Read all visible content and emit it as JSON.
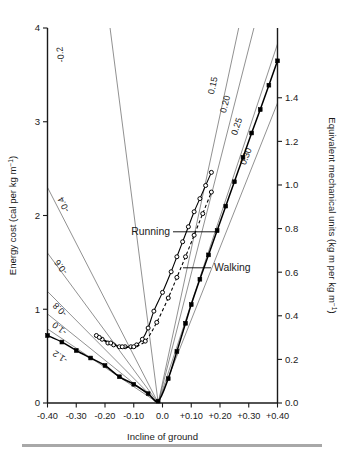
{
  "figure": {
    "background_color": "#ffffff",
    "ink_color": "#1a1a1a",
    "fan_line_color": "#555555",
    "footer_rule_color": "#a8a8a8"
  },
  "axes": {
    "x": {
      "title": "Incline of ground",
      "ticks": [
        "-0.40",
        "-0.30",
        "-0.20",
        "-0.10",
        "0.0",
        "+0.10",
        "+0.20",
        "+0.30",
        "+0.40"
      ],
      "values": [
        -0.4,
        -0.3,
        -0.2,
        -0.1,
        0.0,
        0.1,
        0.2,
        0.3,
        0.4
      ],
      "min": -0.4,
      "max": 0.4
    },
    "y_left": {
      "title": "Energy cost (cal per kg m",
      "title_superscript": "−1",
      "title_tail": ")",
      "ticks": [
        "0",
        "1",
        "2",
        "3",
        "4"
      ],
      "values": [
        0,
        1,
        2,
        3,
        4
      ],
      "min": 0,
      "max": 4
    },
    "y_right": {
      "title": "Equivalent mechanical units (kg m per kg m",
      "title_superscript": "−1",
      "title_tail": ")",
      "ticks": [
        "0.0",
        "0.2",
        "0.4",
        "0.6",
        "0.8",
        "1.0",
        "1.2",
        "1.4"
      ],
      "values": [
        0.0,
        0.2,
        0.4,
        0.6,
        0.8,
        1.0,
        1.2,
        1.4
      ],
      "min": 0.0,
      "max": 1.72
    }
  },
  "annotations": {
    "running_label": "Running",
    "walking_label": "Walking"
  },
  "chart_data": {
    "type": "line",
    "title": "",
    "xlabel": "Incline of ground",
    "ylabel": "Energy cost (cal per kg m−1)",
    "ylabel_secondary": "Equivalent mechanical units (kg m per kg m−1)",
    "xlim": [
      -0.4,
      0.4
    ],
    "ylim": [
      0,
      4
    ],
    "ylim_secondary": [
      0.0,
      1.72
    ],
    "grid": false,
    "legend": "inline-annotations",
    "conversion_note": "right axis = left axis x 0.43 (cal to kg m per kg m-1)",
    "fan_origin": {
      "x": -0.015,
      "y": 0.0
    },
    "efficiency_lines": [
      {
        "label": "-0.2",
        "value": -0.2,
        "label_x": -0.345,
        "label_y": 3.72,
        "end_x": -0.4,
        "end_y": 9.2
      },
      {
        "label": "-0.4",
        "value": -0.4,
        "label_x": -0.335,
        "label_y": 2.13,
        "end_x": -0.4,
        "end_y": 2.3
      },
      {
        "label": "-0.6",
        "value": -0.6,
        "label_x": -0.345,
        "label_y": 1.47,
        "end_x": -0.4,
        "end_y": 1.6
      },
      {
        "label": "-0.8",
        "value": -0.8,
        "label_x": -0.35,
        "label_y": 1.02,
        "end_x": -0.4,
        "end_y": 1.19
      },
      {
        "label": "-1.0",
        "value": -1.0,
        "label_x": -0.352,
        "label_y": 0.82,
        "end_x": -0.4,
        "end_y": 0.95
      },
      {
        "label": "-1.2",
        "value": -1.2,
        "label_x": -0.35,
        "label_y": 0.52,
        "end_x": -0.4,
        "end_y": 0.79
      },
      {
        "label": "0.15",
        "value": 0.15,
        "label_x": 0.185,
        "label_y": 3.38,
        "end_x": 0.265,
        "end_y": 4.0
      },
      {
        "label": "0.20",
        "value": 0.2,
        "label_x": 0.228,
        "label_y": 3.18,
        "end_x": 0.318,
        "end_y": 4.0
      },
      {
        "label": "0.25",
        "value": 0.25,
        "label_x": 0.268,
        "label_y": 2.94,
        "end_x": 0.4,
        "end_y": 3.83
      },
      {
        "label": "0.30",
        "value": 0.3,
        "label_x": 0.3,
        "label_y": 2.62,
        "end_x": 0.4,
        "end_y": 3.2
      }
    ],
    "series": [
      {
        "name": "Walking",
        "marker": "filled-square",
        "line": "solid",
        "x": [
          -0.4,
          -0.35,
          -0.3,
          -0.25,
          -0.2,
          -0.15,
          -0.1,
          -0.05,
          -0.015,
          0.02,
          0.05,
          0.08,
          0.1,
          0.13,
          0.16,
          0.19,
          0.22,
          0.25,
          0.28,
          0.31,
          0.34,
          0.37,
          0.4
        ],
        "y": [
          0.72,
          0.65,
          0.56,
          0.48,
          0.4,
          0.28,
          0.2,
          0.1,
          0.02,
          0.26,
          0.55,
          0.85,
          1.05,
          1.32,
          1.58,
          1.84,
          2.1,
          2.36,
          2.62,
          2.88,
          3.13,
          3.39,
          3.65
        ]
      },
      {
        "name": "Running",
        "marker": "open-circle",
        "line": "solid",
        "x": [
          -0.23,
          -0.21,
          -0.19,
          -0.17,
          -0.15,
          -0.13,
          -0.11,
          -0.09,
          -0.07,
          -0.05,
          -0.03,
          0.0,
          0.03,
          0.05,
          0.07,
          0.09,
          0.11,
          0.13,
          0.15,
          0.17
        ],
        "y": [
          0.72,
          0.68,
          0.64,
          0.62,
          0.6,
          0.6,
          0.6,
          0.62,
          0.68,
          0.8,
          0.98,
          1.18,
          1.4,
          1.56,
          1.72,
          1.88,
          2.04,
          2.18,
          2.32,
          2.46
        ]
      },
      {
        "name": "Running (dashed branch)",
        "marker": "open-circle",
        "line": "dashed",
        "x": [
          -0.22,
          -0.18,
          -0.14,
          -0.1,
          -0.06,
          -0.02,
          0.02,
          0.05,
          0.08,
          0.11,
          0.14,
          0.17
        ],
        "y": [
          0.7,
          0.64,
          0.6,
          0.6,
          0.66,
          0.86,
          1.12,
          1.34,
          1.56,
          1.79,
          2.02,
          2.25
        ]
      }
    ]
  }
}
